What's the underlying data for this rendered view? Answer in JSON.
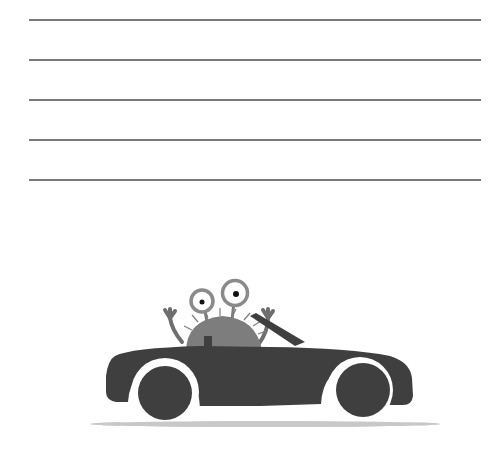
{
  "worksheet": {
    "writing_lines": [
      {
        "y": 19
      },
      {
        "y": 59
      },
      {
        "y": 99
      },
      {
        "y": 139
      },
      {
        "y": 179
      }
    ]
  },
  "illustration": {
    "subject": "monster driving a convertible car",
    "colors": {
      "car": "#3f3f3f",
      "monster": "#7d7d7d",
      "eye_ring": "#8a8a8a",
      "shadow": "#c8c8c8",
      "line": "#7a7a7a"
    }
  }
}
